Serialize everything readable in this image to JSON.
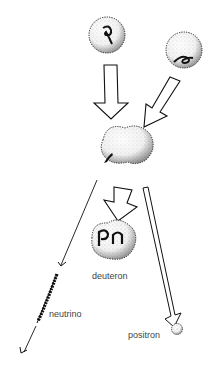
{
  "diagram": {
    "type": "particle-fusion",
    "labels": {
      "deuteron": "deuteron",
      "neutrino": "neutrino",
      "positron": "positron"
    },
    "particles": {
      "proton_1": {
        "glyph": "p",
        "cx": 107,
        "cy": 35,
        "r": 18
      },
      "proton_2": {
        "glyph": "p",
        "cx": 184,
        "cy": 50,
        "r": 18
      },
      "compound": {
        "cx": 127,
        "cy": 152
      },
      "deuteron": {
        "glyphs": "pn",
        "cx": 113,
        "cy": 240
      },
      "positron": {
        "cx": 175,
        "cy": 329,
        "r": 6
      }
    },
    "colors": {
      "ink": "#111111",
      "text": "#444444",
      "background": "#ffffff"
    }
  }
}
